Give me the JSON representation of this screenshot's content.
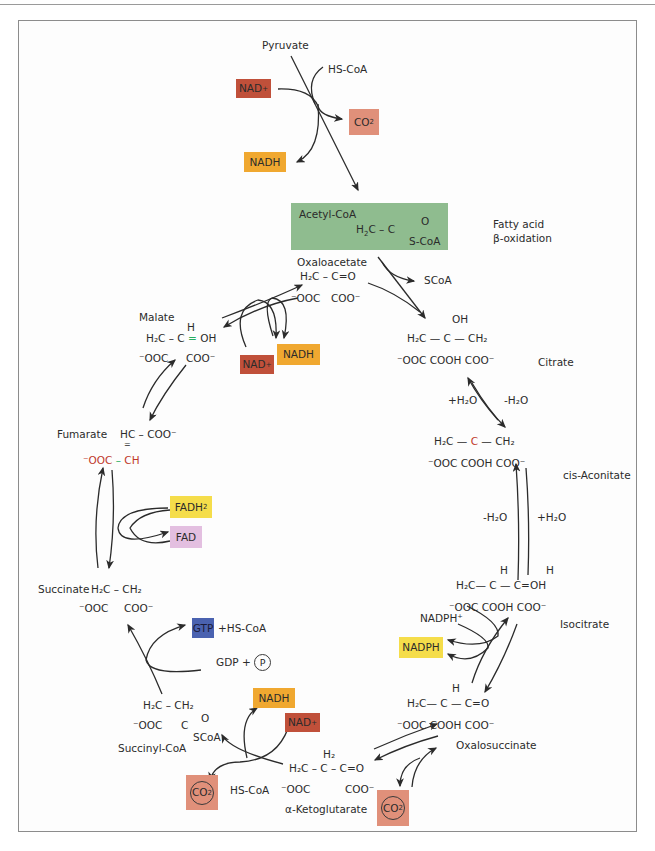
{
  "diagram": {
    "colors": {
      "nad_plus": "#c0503a",
      "nadh": "#f0a830",
      "co2": "#e0907a",
      "acetyl_coa": "#8fbc8f",
      "fadh2": "#f5dd4a",
      "fad": "#e3bfe0",
      "gtp": "#4a62b0",
      "nadph": "#f5dd4a",
      "fatty_acid_arrow": "#b22222"
    },
    "entry": {
      "pyruvate": "Pyruvate",
      "hs_coa": "HS-CoA",
      "nad_plus": "NAD",
      "nad_plus_sup": "+",
      "co2": "CO",
      "co2_sub": "2",
      "nadh": "NADH"
    },
    "acetyl_coa": {
      "label": "Acetyl-CoA",
      "formula_left": "H",
      "formula_left_sub": "2",
      "formula_mid": "C – C",
      "formula_o": "O",
      "formula_scoa": "S-CoA"
    },
    "fatty_acid": {
      "line1": "Fatty acid",
      "line2": "β-oxidation"
    },
    "oxaloacetate": {
      "label": "Oxaloacetate",
      "row1": "H₂C  –  C=O",
      "row2a": "⁻OOC",
      "row2b": "COO⁻",
      "scoa": "SCoA"
    },
    "citrate": {
      "label": "Citrate",
      "oh": "OH",
      "row1": "H₂C — C —   CH₂",
      "row2": "⁻OOC      COOH COO⁻"
    },
    "citrate_to_aconitate": {
      "left": "+H₂O",
      "right": "-H₂O"
    },
    "cis_aconitate": {
      "label": "cis-Aconitate",
      "row1a": "H₂C —",
      "row1c": "C",
      "row1b": "—   CH₂",
      "row2": "⁻OOC      COOH COO⁻"
    },
    "aconitate_to_isocitrate": {
      "left": "-H₂O",
      "right": "+H₂O"
    },
    "isocitrate": {
      "label": "Isocitrate",
      "h1": "H",
      "h2": "H",
      "row1": "H₂C—  C  —  C=OH",
      "row2": "⁻OOC      COOH  COO⁻",
      "nadph_plus": "NADPH⁺",
      "nadph": "NADPH"
    },
    "oxalosuccinate": {
      "label": "Oxalosuccinate",
      "h": "H",
      "row1": "H₂C—  C  —   C=O",
      "row2": "⁻OOC      COOH  COO⁻"
    },
    "alpha_ketoglutarate": {
      "label": "α-Ketoglutarate",
      "h2": "H₂",
      "row1": "H₂C – C – C=O",
      "row2a": "⁻OOC",
      "row2b": "COO⁻",
      "co2": "CO",
      "co2_sub": "2"
    },
    "succinyl_coa": {
      "label": "Succinyl-CoA",
      "row1": "H₂C – CH₂",
      "row2a": "⁻OOC",
      "row2b": "C",
      "o": "O",
      "scoa": "SCoA",
      "hs_coa": "HS-CoA",
      "nadh": "NADH",
      "nad_plus": "NAD",
      "nad_plus_sup": "+",
      "co2": "CO",
      "co2_sub": "2"
    },
    "succinate": {
      "label": "Succinate",
      "row1": "H₂C – CH₂",
      "row2a": "⁻OOC",
      "row2b": "COO⁻",
      "gtp": "GTP",
      "gtp_extra": "+HS-CoA",
      "gdp": "GDP +",
      "p": "P"
    },
    "fumarate": {
      "label": "Fumarate",
      "row1": "HC  –  COO⁻",
      "dbl": "=",
      "row2a": "⁻OOC",
      "row2b": "CH",
      "fadh2": "FADH",
      "fadh2_sub": "2",
      "fad": "FAD"
    },
    "malate": {
      "label": "Malate",
      "h": "H",
      "row1a": "H₂C  –  C",
      "row1b": "OH",
      "row2a": "⁻OOC",
      "row2b": "COO⁻",
      "nad_plus": "NAD",
      "nad_plus_sup": "+",
      "nadh": "NADH"
    }
  }
}
